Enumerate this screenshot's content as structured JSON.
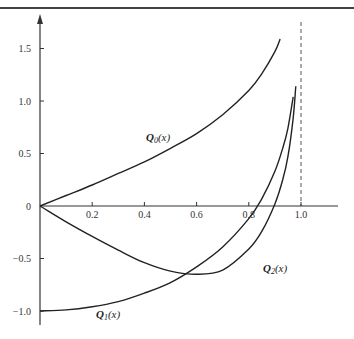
{
  "chart_data": {
    "type": "line",
    "title": "",
    "xlabel": "",
    "ylabel": "",
    "xlim": [
      0,
      1.1
    ],
    "ylim": [
      -1.1,
      1.7
    ],
    "grid": false,
    "legend": "inline labels",
    "x_ticks": [
      "0.2",
      "0.4",
      "0.6",
      "0.8",
      "1.0"
    ],
    "y_ticks": [
      "1.5",
      "1.0",
      "0.5",
      "0",
      "-0.5",
      "-1.0"
    ],
    "asymptote": {
      "x": 1.0,
      "style": "dashed"
    },
    "series": [
      {
        "name": "Q0(x)",
        "label_main": "Q",
        "label_sub": "0",
        "label_arg": "(x)",
        "x": [
          0,
          0.1,
          0.2,
          0.3,
          0.4,
          0.5,
          0.6,
          0.7,
          0.8,
          0.85,
          0.9,
          0.92
        ],
        "y": [
          0,
          0.1,
          0.2,
          0.31,
          0.42,
          0.55,
          0.69,
          0.87,
          1.1,
          1.26,
          1.47,
          1.59
        ]
      },
      {
        "name": "Q1(x)",
        "label_main": "Q",
        "label_sub": "1",
        "label_arg": "(x)",
        "x": [
          0,
          0.1,
          0.2,
          0.3,
          0.4,
          0.5,
          0.6,
          0.7,
          0.8,
          0.85,
          0.9,
          0.93,
          0.95,
          0.97
        ],
        "y": [
          -1.0,
          -0.99,
          -0.96,
          -0.91,
          -0.83,
          -0.73,
          -0.58,
          -0.39,
          -0.12,
          0.07,
          0.33,
          0.55,
          0.74,
          1.04
        ]
      },
      {
        "name": "Q2(x)",
        "label_main": "Q",
        "label_sub": "2",
        "label_arg": "(x)",
        "x": [
          0,
          0.1,
          0.2,
          0.3,
          0.4,
          0.5,
          0.6,
          0.7,
          0.8,
          0.85,
          0.9,
          0.93,
          0.95,
          0.97,
          0.98
        ],
        "y": [
          0,
          -0.15,
          -0.29,
          -0.42,
          -0.54,
          -0.62,
          -0.65,
          -0.61,
          -0.41,
          -0.24,
          0.02,
          0.25,
          0.47,
          0.84,
          1.14
        ]
      }
    ]
  }
}
